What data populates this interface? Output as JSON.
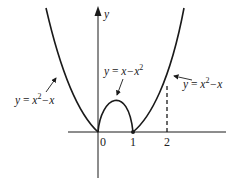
{
  "figure": {
    "axes": {
      "x_axis_label": "",
      "y_axis_label": "y",
      "x_ticks": [
        "0",
        "1",
        "2"
      ]
    },
    "curves": [
      {
        "name": "left-branch",
        "label_lhs": "y",
        "label_eq": "=",
        "label_expr": "x",
        "label_sup": "2",
        "label_rest": "−x",
        "equation": "y = x^2 − x"
      },
      {
        "name": "hump",
        "label_lhs": "y",
        "label_eq": "=",
        "label_expr": "x−x",
        "label_sup": "2",
        "label_rest": "",
        "equation": "y = x − x^2"
      },
      {
        "name": "right-branch",
        "label_lhs": "y",
        "label_eq": "=",
        "label_expr": "x",
        "label_sup": "2",
        "label_rest": "−x",
        "equation": "y = x^2 − x"
      }
    ],
    "dashed_line": {
      "x": "2"
    },
    "colors": {
      "stroke": "#1a1a1a",
      "text": "#222222",
      "background": "#ffffff"
    }
  }
}
